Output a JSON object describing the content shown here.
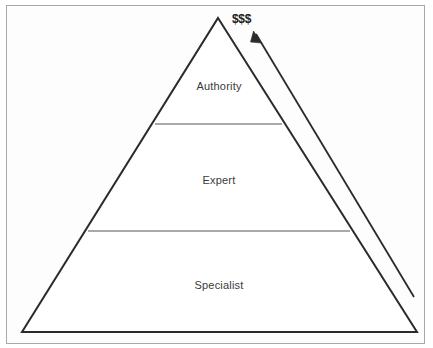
{
  "page": {
    "background_color": "#ffffff",
    "border_color": "#a8a8a8"
  },
  "diagram": {
    "type": "pyramid",
    "orientation": "apex-up",
    "outline_color": "#2b2b2b",
    "divider_color": "#8c8c8c",
    "fill_color": "#ffffff",
    "apex": {
      "x": 218,
      "y": 18
    },
    "base_left": {
      "x": 22,
      "y": 332
    },
    "base_right": {
      "x": 417,
      "y": 332
    },
    "tiers": [
      {
        "label": "Authority",
        "rank": 1,
        "position": "top",
        "label_x": 219,
        "label_y": 86,
        "divider_y": 124,
        "divider_x_start": 155,
        "divider_x_end": 282
      },
      {
        "label": "Expert",
        "rank": 2,
        "position": "middle",
        "label_x": 219,
        "label_y": 180,
        "divider_y": 231,
        "divider_x_start": 88,
        "divider_x_end": 350
      },
      {
        "label": "Specialist",
        "rank": 3,
        "position": "bottom",
        "label_x": 219,
        "label_y": 285,
        "divider_y": null,
        "divider_x_start": null,
        "divider_x_end": null
      }
    ]
  },
  "annotation": {
    "money_label": "$$$",
    "money_label_x": 232,
    "money_label_y": 12,
    "money_label_color": "#202020",
    "arrow": {
      "name": "value-increase-arrow",
      "color": "#2b2b2b",
      "tail": {
        "x": 414,
        "y": 297
      },
      "tip": {
        "x": 254,
        "y": 32
      },
      "direction": "up-left",
      "meaning": "earnings increase toward the apex"
    }
  },
  "icons": {
    "arrow_icon": "arrow-up-left-icon",
    "pyramid_icon": "pyramid-icon"
  }
}
